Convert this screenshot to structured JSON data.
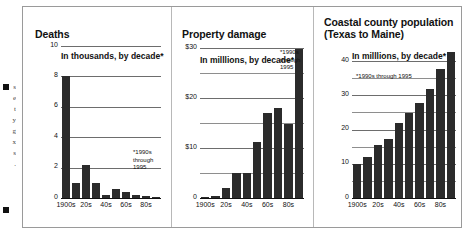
{
  "bleed_text": "s\ne\nt\ny\ng\nx\ns\n.",
  "charts": [
    {
      "id": "deaths",
      "title": "Deaths",
      "subtitle": "In thousands, by decade*",
      "footnote": "*1990s\nthrough\n1995",
      "chart_data": {
        "type": "bar",
        "title": "Deaths",
        "xlabel": "",
        "ylabel": "In thousands, by decade*",
        "ylim": [
          0,
          10
        ],
        "yticks": [
          0,
          2,
          4,
          6,
          8,
          10
        ],
        "ytick_labels": [
          "0",
          "2",
          "4",
          "6",
          "8",
          "10"
        ],
        "grid": true,
        "categories": [
          "1900s",
          "10s",
          "20s",
          "30s",
          "40s",
          "50s",
          "60s",
          "70s",
          "80s",
          "90s"
        ],
        "tick_labels": [
          "1900s",
          "20s",
          "40s",
          "60s",
          "80s"
        ],
        "values": [
          8.1,
          1.0,
          2.2,
          1.0,
          0.18,
          0.6,
          0.4,
          0.22,
          0.15,
          0.05
        ]
      }
    },
    {
      "id": "property-damage",
      "title": "Property damage",
      "subtitle": "In milllions, by decade*",
      "footnote": "*1990s\nthrough\n1995",
      "chart_data": {
        "type": "bar",
        "title": "Property damage",
        "xlabel": "",
        "ylabel": "In milllions, by decade*",
        "ylim": [
          0,
          30
        ],
        "yticks": [
          0,
          5,
          10,
          15,
          20,
          25,
          30
        ],
        "ytick_labels": [
          "0",
          "",
          "$10",
          "",
          "$20",
          "",
          "$30"
        ],
        "grid": true,
        "categories": [
          "1900s",
          "10s",
          "20s",
          "30s",
          "40s",
          "50s",
          "60s",
          "70s",
          "80s",
          "90s"
        ],
        "tick_labels": [
          "1900s",
          "20s",
          "40s",
          "60s",
          "80s"
        ],
        "values": [
          0.3,
          0.4,
          2.0,
          5.0,
          5.0,
          11.2,
          17.2,
          18.2,
          15.0,
          30.0
        ]
      }
    },
    {
      "id": "coastal-county-population",
      "title": "Coastal county population (Texas to Maine)",
      "subtitle": "In milllions, by decade*",
      "footnote": "*1990s through 1995",
      "chart_data": {
        "type": "bar",
        "title": "Coastal county population (Texas to Maine)",
        "xlabel": "",
        "ylabel": "In milllions, by decade*",
        "ylim": [
          0,
          45
        ],
        "yticks": [
          0,
          5,
          10,
          15,
          20,
          25,
          30,
          35,
          40
        ],
        "ytick_labels": [
          "0",
          "",
          "10",
          "",
          "20",
          "",
          "30",
          "",
          "40"
        ],
        "grid": true,
        "categories": [
          "1900s",
          "10s",
          "20s",
          "30s",
          "40s",
          "50s",
          "60s",
          "70s",
          "80s",
          "90s"
        ],
        "tick_labels": [
          "1900s",
          "20s",
          "40s",
          "60s",
          "80s"
        ],
        "values": [
          10,
          12,
          15.5,
          17.5,
          22,
          25,
          28,
          32,
          38,
          43
        ]
      }
    }
  ],
  "colors": {
    "bar": "#2b2b2b",
    "grid": "#8e8e8e",
    "axis": "#111111",
    "frame": "#9a9a9a",
    "background": "#ffffff"
  }
}
